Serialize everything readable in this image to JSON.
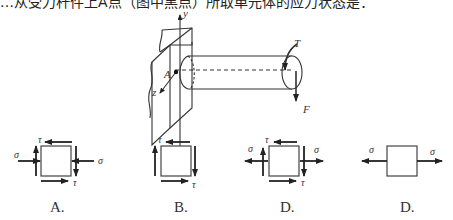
{
  "question": {
    "partial_top_text": "…从受力杆件上A点（图中黑点）所取单元体的应力状态是："
  },
  "main_figure": {
    "labels": {
      "y_axis": "y",
      "z_axis": "z",
      "point": "A",
      "torque": "T",
      "force": "F"
    }
  },
  "options": [
    {
      "letter": "A.",
      "labels": {
        "sigma_left": "σ",
        "sigma_right": "σ",
        "tau_top": "τ",
        "tau_bottom": "τ"
      }
    },
    {
      "letter": "B.",
      "labels": {
        "tau_top": "τ",
        "tau_bottom": "τ"
      }
    },
    {
      "letter": "C.",
      "labels": {
        "sigma_left": "σ",
        "sigma_right": "σ",
        "tau_top": "τ",
        "tau_bottom": "τ"
      }
    },
    {
      "letter": "D.",
      "labels": {
        "sigma_left": "σ",
        "sigma_right": "σ"
      }
    }
  ]
}
